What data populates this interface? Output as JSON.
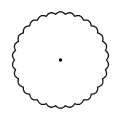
{
  "figure": {
    "shape": "scalloped-circle",
    "center": [
      60.5,
      60
    ],
    "radius": 46,
    "scallop_count": 30,
    "scallop_depth": 2.2,
    "stroke_color": "#111111",
    "fill_color": "#ffffff",
    "center_dot": {
      "x": 60.5,
      "y": 60,
      "r": 1.7,
      "color": "#000000"
    }
  }
}
